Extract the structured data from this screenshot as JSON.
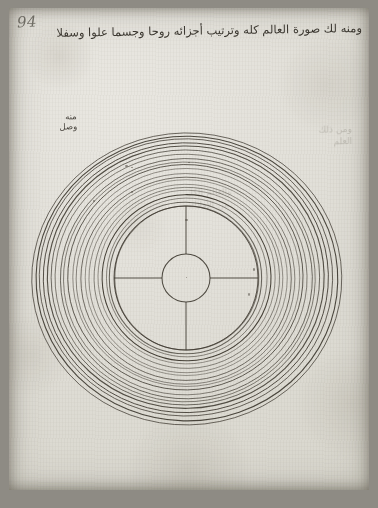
{
  "document": {
    "type": "manuscript-folio-scan",
    "folio_number": "94",
    "heading_text": "ومنه لك صورة العالم كله وترتيب أجزائه روحا وجسما علوا وسفلا",
    "marginal_note": {
      "line1": "منه",
      "line2": "وصل"
    },
    "ghost_note": {
      "line1": "ومن ذلك",
      "line2": "العلم"
    },
    "ghost_block": {
      "line1": "والعالم الكل",
      "line2": "من الأفلاك"
    }
  },
  "diagram": {
    "name": "concentric-spheres-cosmological-diagram",
    "center": {
      "x": 186,
      "y": 278
    },
    "outer_radius_x": 155,
    "outer_radius_y": 146,
    "inner_core_radius": 24,
    "hub_circle_radius": 72,
    "ring_count": 21,
    "radial_spokes": 4,
    "spoke_angles_deg": [
      0,
      90,
      180,
      270
    ],
    "ink_color": "#3a352c",
    "ring_stroke_width": 0.85
  },
  "colors": {
    "paper": "#e4e2db",
    "ink": "#2e2a23",
    "pencil": "#5d5a52",
    "scan_frame": "#8e8b84"
  }
}
